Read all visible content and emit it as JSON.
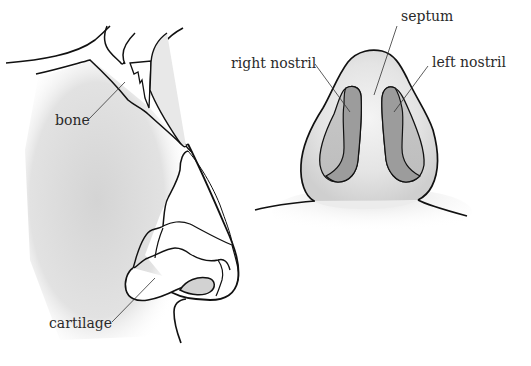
{
  "diagram": {
    "views": [
      {
        "id": "side-view",
        "name": "Side profile of nose"
      },
      {
        "id": "front-view",
        "name": "Underside view of nose showing nostrils"
      }
    ],
    "labels": {
      "bone": "bone",
      "cartilage": "cartilage",
      "septum": "septum",
      "right_nostril": "right nostril",
      "left_nostril": "left nostril"
    },
    "colors": {
      "outline": "#111111",
      "leader_line": "#333333",
      "skin_shade": "#d6d6d6",
      "nostril_fill": "#9a9a9a",
      "background": "#ffffff"
    }
  }
}
